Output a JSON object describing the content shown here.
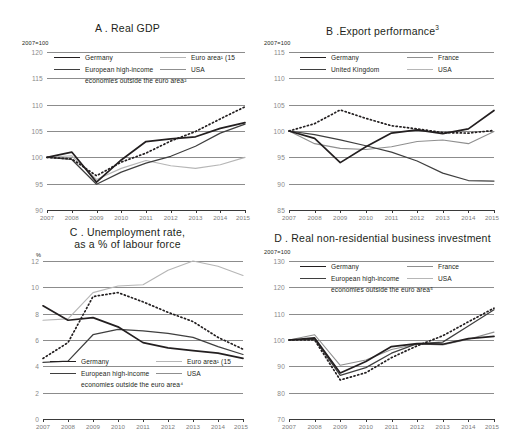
{
  "figure": {
    "background": "#ffffff",
    "series_colors": {
      "germany": "#231f20",
      "european_high_income": "#3f3f3f",
      "united_kingdom": "#3f3f3f",
      "euro_area": "#b6b6b6",
      "france": "#8f8f8f",
      "usa": "#231f20"
    },
    "x_tick_labels": [
      "2007",
      "2008",
      "2009",
      "2010",
      "2011",
      "2012",
      "2013",
      "2014",
      "2015"
    ]
  },
  "chart_data": [
    {
      "id": "panel-a",
      "type": "line",
      "title": "A . Real GDP",
      "title_text": "A . Real GDP",
      "unit": "2007=100",
      "xlabel": "",
      "ylabel": "",
      "ylim": [
        90,
        120
      ],
      "yticks": [
        90,
        95,
        100,
        105,
        110,
        115,
        120
      ],
      "ytick_labels": [
        "90",
        "95",
        "100",
        "105",
        "110",
        "115",
        "120"
      ],
      "x": [
        2007,
        2008,
        2009,
        2010,
        2011,
        2012,
        2013,
        2014,
        2015
      ],
      "grid": true,
      "legend_position": "top-inside",
      "series": [
        {
          "name": "Germany",
          "style": "solid-black",
          "values": [
            100,
            101,
            95.3,
            99.5,
            103,
            103.5,
            103.9,
            105.5,
            106.6
          ]
        },
        {
          "name": "European high-income economies outside the euro area",
          "style": "solid-dark",
          "values": [
            100,
            99.6,
            94.9,
            97.2,
            98.9,
            100.2,
            102.1,
            104.6,
            106.3
          ]
        },
        {
          "name": "Euro area (15)",
          "style": "solid-lgrey",
          "values": [
            100,
            100.3,
            95.8,
            97.9,
            99.4,
            98.4,
            97.9,
            98.6,
            100.0
          ]
        },
        {
          "name": "USA",
          "style": "dotted-black",
          "values": [
            100,
            99.7,
            96.5,
            99.1,
            100.8,
            103.1,
            104.9,
            107.3,
            109.6
          ]
        }
      ],
      "legend": [
        {
          "label": "Germany",
          "style": "solid-black"
        },
        {
          "label": "Euro area¹ (15",
          "style": "solid-lgrey"
        },
        {
          "label": "European high-income",
          "style": "solid-dark"
        },
        {
          "label": "USA",
          "style": "solid-grey"
        },
        {
          "label": "economies outside the euro area²",
          "style": "none"
        }
      ]
    },
    {
      "id": "panel-b",
      "type": "line",
      "title": "B .Export performance³",
      "title_text": "B .Export performance",
      "title_sup": "3",
      "unit": "2007=100",
      "xlabel": "",
      "ylabel": "",
      "ylim": [
        85,
        115
      ],
      "yticks": [
        85,
        90,
        95,
        100,
        105,
        110,
        115
      ],
      "ytick_labels": [
        "85",
        "90",
        "95",
        "100",
        "105",
        "110",
        "115"
      ],
      "x": [
        2007,
        2008,
        2009,
        2010,
        2011,
        2012,
        2013,
        2014,
        2015
      ],
      "grid": true,
      "legend_position": "top-inside",
      "series": [
        {
          "name": "Germany",
          "style": "solid-black",
          "values": [
            100,
            98.6,
            94.0,
            97.0,
            99.6,
            100.2,
            99.5,
            100.4,
            103.9
          ]
        },
        {
          "name": "United Kingdom",
          "style": "solid-dark",
          "values": [
            100,
            99.3,
            98.3,
            97.2,
            96.0,
            94.3,
            92.0,
            90.6,
            90.5
          ]
        },
        {
          "name": "France",
          "style": "solid-grey",
          "values": [
            100,
            97.6,
            96.7,
            96.5,
            97.0,
            98.0,
            98.3,
            97.6,
            99.9
          ]
        },
        {
          "name": "USA",
          "style": "dotted-black",
          "values": [
            100,
            101.4,
            104.0,
            102.4,
            101.0,
            100.4,
            99.7,
            99.6,
            100.1
          ]
        }
      ],
      "legend": [
        {
          "label": "Germany",
          "style": "solid-black"
        },
        {
          "label": "France",
          "style": "solid-grey"
        },
        {
          "label": "United Kingdom",
          "style": "solid-dark"
        },
        {
          "label": "USA",
          "style": "solid-lgrey"
        }
      ]
    },
    {
      "id": "panel-c",
      "type": "line",
      "title": "C . Unemployment rate, as a % of labour force",
      "title_line1": "C . Unemployment rate,",
      "title_line2": "as a % of labour force",
      "unit": "%",
      "xlabel": "",
      "ylabel": "",
      "ylim": [
        0,
        12
      ],
      "yticks": [
        0,
        2,
        4,
        6,
        8,
        10,
        12
      ],
      "ytick_labels": [
        "0",
        "2",
        "4",
        "6",
        "8",
        "10",
        "12"
      ],
      "x": [
        2007,
        2008,
        2009,
        2010,
        2011,
        2012,
        2013,
        2014,
        2015
      ],
      "grid": true,
      "legend_position": "bottom-inside",
      "series": [
        {
          "name": "Germany",
          "style": "solid-black",
          "values": [
            8.6,
            7.5,
            7.7,
            7.0,
            5.8,
            5.4,
            5.2,
            5.0,
            4.6
          ]
        },
        {
          "name": "European high-income economies outside the euro area",
          "style": "solid-dark",
          "values": [
            4.3,
            4.4,
            6.4,
            6.8,
            6.7,
            6.5,
            6.2,
            5.5,
            4.9
          ]
        },
        {
          "name": "Euro area (15)",
          "style": "solid-lgrey",
          "values": [
            7.5,
            7.6,
            9.6,
            10.1,
            10.2,
            11.3,
            12.0,
            11.6,
            10.9
          ]
        },
        {
          "name": "USA",
          "style": "dotted-black",
          "values": [
            4.6,
            5.8,
            9.3,
            9.6,
            8.9,
            8.1,
            7.4,
            6.2,
            5.3
          ]
        }
      ],
      "legend": [
        {
          "label": "Germany",
          "style": "solid-black"
        },
        {
          "label": "Euro area¹ (15",
          "style": "solid-lgrey"
        },
        {
          "label": "European high-income",
          "style": "solid-dark"
        },
        {
          "label": "USA",
          "style": "solid-grey"
        },
        {
          "label": "economies outside the euro area⁴",
          "style": "none"
        }
      ]
    },
    {
      "id": "panel-d",
      "type": "line",
      "title": "D . Real non-residential business investment",
      "title_text": "D . Real non-residential business investment",
      "unit": "2007=100",
      "xlabel": "",
      "ylabel": "",
      "ylim": [
        70,
        130
      ],
      "yticks": [
        70,
        80,
        90,
        100,
        110,
        120,
        130
      ],
      "ytick_labels": [
        "70",
        "80",
        "90",
        "100",
        "110",
        "120",
        "130"
      ],
      "x": [
        2007,
        2008,
        2009,
        2010,
        2011,
        2012,
        2013,
        2014,
        2015
      ],
      "grid": true,
      "legend_position": "top-inside",
      "series": [
        {
          "name": "Germany",
          "style": "solid-black",
          "values": [
            100,
            100.8,
            87.5,
            91.8,
            97.5,
            98.6,
            98.4,
            100.5,
            101.4
          ]
        },
        {
          "name": "European high-income economies outside the euro area",
          "style": "solid-dark",
          "values": [
            100,
            100.3,
            86.6,
            89.5,
            95.0,
            98.6,
            99.2,
            105.3,
            111.5
          ]
        },
        {
          "name": "France",
          "style": "solid-grey",
          "values": [
            100,
            102.0,
            90.4,
            92.4,
            96.4,
            98.5,
            98.1,
            100.3,
            103.0
          ]
        },
        {
          "name": "USA",
          "style": "dotted-black",
          "values": [
            100,
            100.0,
            84.8,
            87.6,
            93.3,
            97.8,
            101.6,
            106.9,
            112.1
          ]
        }
      ],
      "legend": [
        {
          "label": "Germany",
          "style": "solid-black"
        },
        {
          "label": "France",
          "style": "solid-grey"
        },
        {
          "label": "European high-income",
          "style": "solid-dark"
        },
        {
          "label": "USA",
          "style": "solid-lgrey"
        },
        {
          "label": "economies outside the euro area⁵",
          "style": "none"
        }
      ]
    }
  ]
}
